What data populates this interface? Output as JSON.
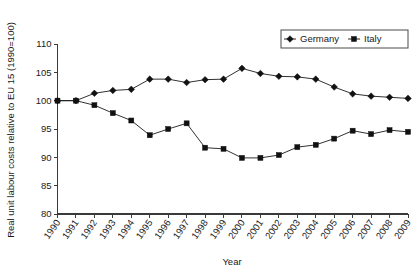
{
  "chart_data": {
    "type": "line",
    "title": "",
    "xlabel": "Year",
    "ylabel": "Real unit labour costs relative to EU 15 (1990=100)",
    "categories": [
      "1990",
      "1991",
      "1992",
      "1993",
      "1994",
      "1995",
      "1996",
      "1997",
      "1998",
      "1999",
      "2000",
      "2001",
      "2002",
      "2003",
      "2004",
      "2005",
      "2006",
      "2007",
      "2008",
      "2009"
    ],
    "xtick_labels": [
      "1990",
      "1991",
      "1992",
      "1993",
      "1994",
      "1995",
      "1996",
      "1997",
      "1998",
      "1999",
      "2000",
      "2001",
      "2002",
      "2003",
      "2004",
      "2005",
      "2006",
      "2007",
      "2008",
      "2009"
    ],
    "ytick_labels": [
      "80",
      "85",
      "90",
      "95",
      "100",
      "105",
      "110"
    ],
    "ytick_values": [
      80,
      85,
      90,
      95,
      100,
      105,
      110
    ],
    "ylim": [
      80,
      110
    ],
    "grid": false,
    "legend_position": "top-right",
    "series": [
      {
        "name": "Germany",
        "marker": "diamond",
        "color": "#111111",
        "values": [
          100.0,
          100.0,
          101.3,
          101.8,
          102.0,
          103.8,
          103.8,
          103.2,
          103.7,
          103.8,
          105.7,
          104.8,
          104.3,
          104.2,
          103.8,
          102.4,
          101.2,
          100.8,
          100.6,
          100.4
        ]
      },
      {
        "name": "Italy",
        "marker": "square",
        "color": "#111111",
        "values": [
          100.0,
          100.0,
          99.2,
          97.8,
          96.5,
          93.9,
          95.0,
          96.0,
          91.7,
          91.5,
          89.9,
          89.9,
          90.4,
          91.8,
          92.2,
          93.3,
          94.7,
          94.1,
          94.8,
          94.5
        ]
      }
    ],
    "legend": [
      {
        "label": "Germany",
        "marker": "diamond"
      },
      {
        "label": "Italy",
        "marker": "square"
      }
    ]
  }
}
